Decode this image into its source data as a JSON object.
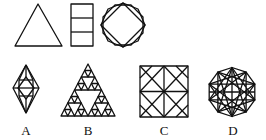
{
  "puzzle": {
    "question_figures": [
      {
        "name": "triangle",
        "description": "equilateral triangle"
      },
      {
        "name": "stacked-rectangle",
        "description": "rectangle divided into three horizontal cells"
      },
      {
        "name": "octagon-with-inscribed-square",
        "description": "octagon overlapped with a square (star octagon)"
      }
    ],
    "options": [
      {
        "label": "A",
        "description": "rhombus containing an octagon and square with crossing lines"
      },
      {
        "label": "B",
        "description": "Sierpinski-style nested triangles"
      },
      {
        "label": "C",
        "description": "square grid with diagonals and crossing lines"
      },
      {
        "label": "D",
        "description": "decagon with inscribed ten-pointed star"
      }
    ]
  },
  "colors": {
    "stroke": "#111111",
    "background": "#ffffff"
  }
}
